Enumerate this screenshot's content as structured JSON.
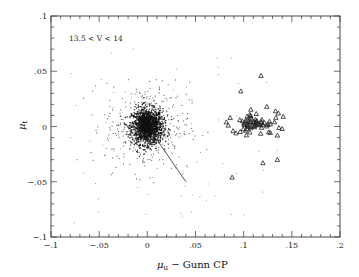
{
  "chart_data": {
    "type": "scatter",
    "title": "",
    "annotation": "13.5 < V < 14",
    "xlabel": "μ_u − Gunn CP",
    "xlabel_main": "μ",
    "xlabel_sub": "u",
    "xlabel_rest": " − Gunn CP",
    "ylabel": "μ_t",
    "ylabel_main": "μ",
    "ylabel_sub": "t",
    "xlim": [
      -0.1,
      0.2
    ],
    "ylim": [
      -0.1,
      0.1
    ],
    "grid": false,
    "legend": null,
    "x_ticks": [
      {
        "value": -0.1,
        "label": "-.1"
      },
      {
        "value": -0.05,
        "label": "-.05"
      },
      {
        "value": 0,
        "label": "0"
      },
      {
        "value": 0.05,
        "label": ".05"
      },
      {
        "value": 0.1,
        "label": ".1"
      },
      {
        "value": 0.15,
        "label": ".15"
      },
      {
        "value": 0.2,
        "label": ".2"
      }
    ],
    "y_ticks": [
      {
        "value": 0.1,
        "label": ".1"
      },
      {
        "value": 0.05,
        "label": ".05"
      },
      {
        "value": 0,
        "label": "0"
      },
      {
        "value": -0.05,
        "label": "-.05"
      },
      {
        "value": -0.1,
        "label": "-.1"
      }
    ],
    "x_minor_step": 0.01,
    "y_minor_step": 0.01,
    "series": [
      {
        "name": "field stars (dots)",
        "marker": "dot",
        "distribution": "gaussian-cluster",
        "center": [
          0.0,
          0.0
        ],
        "sigma_core": [
          0.008,
          0.008
        ],
        "count_core": 1400,
        "sigma_halo": [
          0.022,
          0.02
        ],
        "count_halo": 380,
        "sparse_scatter_count": 70,
        "note": "Dense core centered near (0,0), diffuse halo to ~±0.06"
      },
      {
        "name": "cluster members (triangles)",
        "marker": "triangle",
        "distribution": "gaussian-cluster",
        "center": [
          0.112,
          0.003
        ],
        "sigma": [
          0.009,
          0.005
        ],
        "count": 60,
        "explicit_points": [
          [
            0.118,
            0.046
          ],
          [
            0.097,
            0.032
          ],
          [
            0.124,
            0.018
          ],
          [
            0.133,
            0.014
          ],
          [
            0.136,
            0.012
          ],
          [
            0.141,
            0.009
          ],
          [
            0.086,
            0.008
          ],
          [
            0.096,
            0.006
          ],
          [
            0.082,
            0.004
          ],
          [
            0.084,
            0.001
          ],
          [
            0.089,
            -0.004
          ],
          [
            0.092,
            -0.006
          ],
          [
            0.14,
            -0.002
          ],
          [
            0.135,
            -0.008
          ],
          [
            0.126,
            -0.005
          ],
          [
            0.12,
            -0.033
          ],
          [
            0.135,
            -0.03
          ],
          [
            0.088,
            -0.046
          ]
        ]
      }
    ],
    "line": {
      "name": "trail",
      "from": [
        0.01,
        -0.012
      ],
      "to": [
        0.04,
        -0.05
      ]
    }
  },
  "labels": {
    "annotation": "13.5 < V < 14"
  }
}
